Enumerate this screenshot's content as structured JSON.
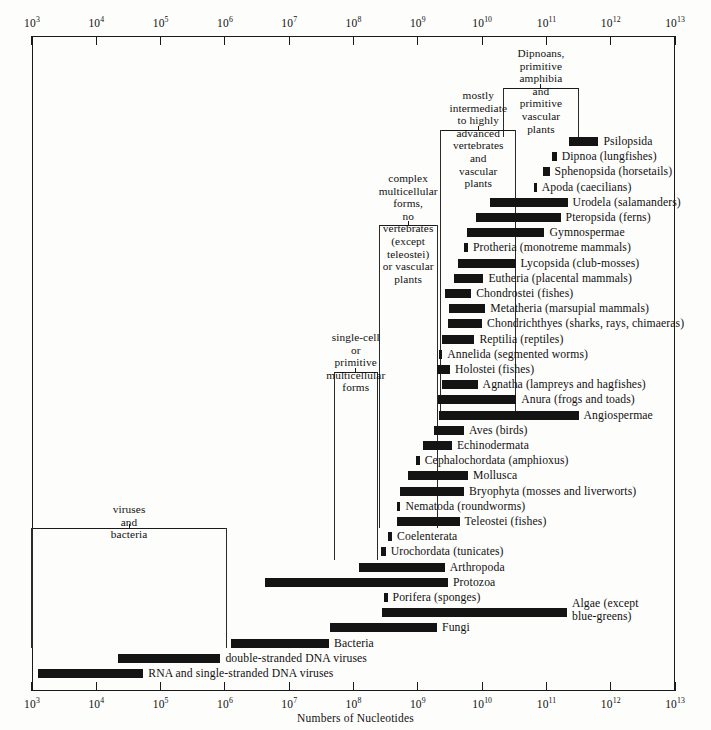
{
  "figure": {
    "axis_title": "Numbers of Nucleotides",
    "axis_ticks": [
      "10^3",
      "10^4",
      "10^5",
      "10^6",
      "10^7",
      "10^8",
      "10^9",
      "10^10",
      "10^11",
      "10^12",
      "10^13"
    ],
    "tick_mantissa": [
      "10",
      "10",
      "10",
      "10",
      "10",
      "10",
      "10",
      "10",
      "10",
      "10",
      "10"
    ],
    "tick_exponents": [
      "3",
      "4",
      "5",
      "6",
      "7",
      "8",
      "9",
      "10",
      "11",
      "12",
      "13"
    ]
  },
  "chart_data": {
    "type": "bar",
    "title": "",
    "xlabel": "Numbers of Nucleotides",
    "ylabel": "",
    "xscale": "log10",
    "xlim": [
      3,
      13
    ],
    "grid": false,
    "legend": "none",
    "note": "Horizontal range bars: each taxon spans a minimum-to-maximum genome size in nucleotides (log10 exponents).",
    "bars": [
      {
        "label": "Psilopsida",
        "x0": 11.35,
        "x1": 11.81,
        "row": 0
      },
      {
        "label": "Dipnoa (lungfishes)",
        "x0": 11.08,
        "x1": 11.16,
        "row": 1
      },
      {
        "label": "Sphenopsida (horsetails)",
        "x0": 10.95,
        "x1": 11.05,
        "row": 2
      },
      {
        "label": "Apoda (caecilians)",
        "x0": 10.8,
        "x1": 10.85,
        "row": 3
      },
      {
        "label": "Urodela (salamanders)",
        "x0": 10.12,
        "x1": 11.33,
        "row": 4
      },
      {
        "label": "Pteropsida (ferns)",
        "x0": 9.9,
        "x1": 11.22,
        "row": 5
      },
      {
        "label": "Gymnospermae",
        "x0": 9.77,
        "x1": 10.97,
        "row": 6
      },
      {
        "label": "Protheria (monotreme mammals)",
        "x0": 9.72,
        "x1": 9.78,
        "row": 7
      },
      {
        "label": "Lycopsida (club-mosses)",
        "x0": 9.62,
        "x1": 10.52,
        "row": 8
      },
      {
        "label": "Eutheria (placental mammals)",
        "x0": 9.57,
        "x1": 10.02,
        "row": 9
      },
      {
        "label": "Chondrostei (fishes)",
        "x0": 9.42,
        "x1": 9.83,
        "row": 10
      },
      {
        "label": "Metatheria (marsupial mammals)",
        "x0": 9.48,
        "x1": 10.05,
        "row": 11
      },
      {
        "label": "Chondrichthyes (sharks, rays, chimaeras)",
        "x0": 9.47,
        "x1": 10.0,
        "row": 12
      },
      {
        "label": "Reptilia (reptiles)",
        "x0": 9.38,
        "x1": 9.88,
        "row": 13
      },
      {
        "label": "Annelida (segmented worms)",
        "x0": 9.33,
        "x1": 9.38,
        "row": 14
      },
      {
        "label": "Holostei (fishes)",
        "x0": 9.3,
        "x1": 9.5,
        "row": 15
      },
      {
        "label": "Agnatha (lampreys and hagfishes)",
        "x0": 9.38,
        "x1": 9.93,
        "row": 16
      },
      {
        "label": "Anura (frogs and toads)",
        "x0": 9.32,
        "x1": 10.53,
        "row": 17
      },
      {
        "label": "Angiospermae",
        "x0": 9.33,
        "x1": 11.5,
        "row": 18
      },
      {
        "label": "Aves (birds)",
        "x0": 9.25,
        "x1": 9.72,
        "row": 19
      },
      {
        "label": "Echinodermata",
        "x0": 9.08,
        "x1": 9.53,
        "row": 20
      },
      {
        "label": "Cephalochordata (amphioxus)",
        "x0": 8.97,
        "x1": 9.03,
        "row": 21
      },
      {
        "label": "Mollusca",
        "x0": 8.85,
        "x1": 9.78,
        "row": 22
      },
      {
        "label": "Bryophyta (mosses and liverworts)",
        "x0": 8.73,
        "x1": 9.72,
        "row": 23
      },
      {
        "label": "Nematoda (roundworms)",
        "x0": 8.67,
        "x1": 8.73,
        "row": 24
      },
      {
        "label": "Teleostei (fishes)",
        "x0": 8.68,
        "x1": 9.65,
        "row": 25
      },
      {
        "label": "Coelenterata",
        "x0": 8.53,
        "x1": 8.6,
        "row": 26
      },
      {
        "label": "Urochordata (tunicates)",
        "x0": 8.42,
        "x1": 8.5,
        "row": 27
      },
      {
        "label": "Arthropoda",
        "x0": 8.08,
        "x1": 9.42,
        "row": 28
      },
      {
        "label": "Protozoa",
        "x0": 6.62,
        "x1": 9.47,
        "row": 29
      },
      {
        "label": "Porifera (sponges)",
        "x0": 8.47,
        "x1": 8.53,
        "row": 30
      },
      {
        "label": "Algae (except blue-greens)",
        "x0": 8.45,
        "x1": 11.32,
        "row": 31
      },
      {
        "label": "Fungi",
        "x0": 7.63,
        "x1": 9.3,
        "row": 32
      },
      {
        "label": "Bacteria",
        "x0": 6.1,
        "x1": 7.62,
        "row": 33
      },
      {
        "label": "double-stranded DNA viruses",
        "x0": 4.33,
        "x1": 5.93,
        "row": 34
      },
      {
        "label": "RNA and single-stranded DNA viruses",
        "x0": 3.1,
        "x1": 4.73,
        "row": 35
      }
    ],
    "group_brackets": [
      {
        "label": "Dipnoans, primitive amphibia and\nprimitive vascular plants",
        "x0": 10.33,
        "x1": 11.5
      },
      {
        "label": "mostly intermediate\nto highly advanced\nvertebrates and vascular plants",
        "x0": 9.36,
        "x1": 10.52
      },
      {
        "label": "complex multicellular forms,\nno vertebrates (except teleostei)\nor vascular plants",
        "x0": 8.4,
        "x1": 9.3
      },
      {
        "label": "single-cell or\nprimitive multicellular\nforms",
        "x0": 7.7,
        "x1": 8.37
      },
      {
        "label": "viruses and bacteria",
        "x0": 3.0,
        "x1": 6.02
      }
    ]
  }
}
